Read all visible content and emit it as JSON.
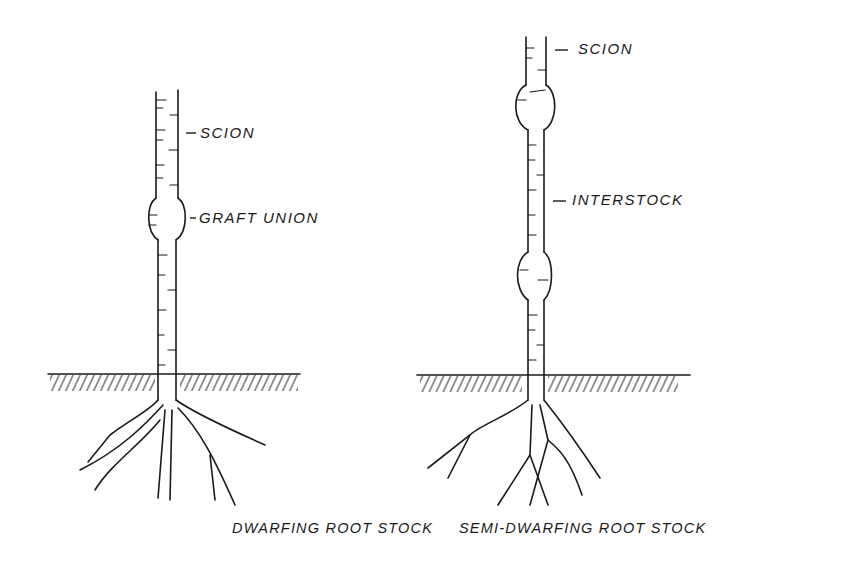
{
  "diagrams": [
    {
      "title": "DWARFING ROOT STOCK",
      "labels": {
        "scion": "SCION",
        "graft_union": "GRAFT UNION"
      }
    },
    {
      "title": "SEMI-DWARFING ROOT STOCK",
      "labels": {
        "scion": "SCION",
        "interstock": "INTERSTOCK"
      }
    }
  ],
  "colors": {
    "ink": "#1a1a1a",
    "background": "#ffffff"
  }
}
